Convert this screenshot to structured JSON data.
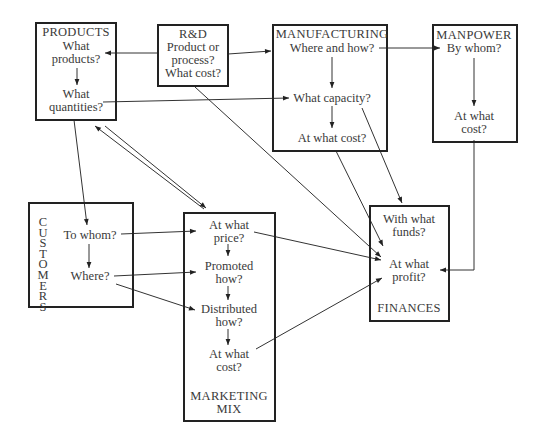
{
  "diagram": {
    "type": "flow-diagram",
    "boxes": {
      "products": {
        "title": "PRODUCTS",
        "q1": "What\nproducts?",
        "q2": "What\nquantities?"
      },
      "rnd": {
        "title": "R&D",
        "q1": "Product or\nprocess?",
        "q2": "What cost?"
      },
      "manufacturing": {
        "title": "MANUFACTURING",
        "q1": "Where and how?",
        "q2": "What capacity?",
        "q3": "At what cost?"
      },
      "manpower": {
        "title": "MANPOWER",
        "q1": "By whom?",
        "q2": "At what\ncost?"
      },
      "customers": {
        "title": "C\nU\nS\nT\nO\nM\nE\nR\nS",
        "q1": "To whom?",
        "q2": "Where?"
      },
      "marketing_mix": {
        "title": "MARKETING\nMIX",
        "q1": "At what\nprice?",
        "q2": "Promoted\nhow?",
        "q3": "Distributed\nhow?",
        "q4": "At what\ncost?"
      },
      "finances": {
        "title": "FINANCES",
        "q1": "With what\nfunds?",
        "q2": "At what\nprofit?"
      }
    },
    "edges": [
      {
        "from": "R&D",
        "to": "PRODUCTS: What products?"
      },
      {
        "from": "R&D",
        "to": "MANUFACTURING"
      },
      {
        "from": "R&D",
        "to": "FINANCES: At what profit?"
      },
      {
        "from": "PRODUCTS: What products?",
        "to": "PRODUCTS: What quantities?"
      },
      {
        "from": "PRODUCTS: What quantities?",
        "to": "MANUFACTURING: What capacity?"
      },
      {
        "from": "PRODUCTS",
        "to": "CUSTOMERS: To whom?"
      },
      {
        "from": "PRODUCTS",
        "to": "MARKETING MIX"
      },
      {
        "from": "MARKETING MIX",
        "to": "PRODUCTS"
      },
      {
        "from": "MANUFACTURING: Where and how?",
        "to": "MANUFACTURING: What capacity?"
      },
      {
        "from": "MANUFACTURING: What capacity?",
        "to": "MANUFACTURING: At what cost?"
      },
      {
        "from": "MANUFACTURING: Where and how?",
        "to": "MANPOWER: By whom?"
      },
      {
        "from": "MANUFACTURING: What capacity?",
        "to": "FINANCES"
      },
      {
        "from": "MANUFACTURING: At what cost?",
        "to": "FINANCES: At what profit?"
      },
      {
        "from": "MANPOWER: By whom?",
        "to": "MANPOWER: At what cost?"
      },
      {
        "from": "MANPOWER: At what cost?",
        "to": "FINANCES: At what profit?"
      },
      {
        "from": "CUSTOMERS: To whom?",
        "to": "CUSTOMERS: Where?"
      },
      {
        "from": "CUSTOMERS: To whom?",
        "to": "MARKETING MIX: At what price?"
      },
      {
        "from": "CUSTOMERS: Where?",
        "to": "MARKETING MIX: Promoted how?"
      },
      {
        "from": "CUSTOMERS: Where?",
        "to": "MARKETING MIX: Distributed how?"
      },
      {
        "from": "MARKETING MIX: At what price?",
        "to": "MARKETING MIX: Promoted how?"
      },
      {
        "from": "MARKETING MIX: Promoted how?",
        "to": "MARKETING MIX: Distributed how?"
      },
      {
        "from": "MARKETING MIX: Distributed how?",
        "to": "MARKETING MIX: At what cost?"
      },
      {
        "from": "MARKETING MIX: At what price?",
        "to": "FINANCES: At what profit?"
      },
      {
        "from": "MARKETING MIX: At what cost?",
        "to": "FINANCES: At what profit?"
      }
    ]
  }
}
